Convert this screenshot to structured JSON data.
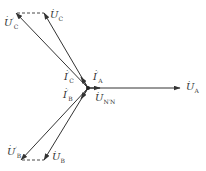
{
  "diagram": {
    "type": "phasor-diagram",
    "origin": {
      "x": 88,
      "y": 88
    },
    "colors": {
      "line": "#333333",
      "background": "#ffffff"
    },
    "vectors": [
      {
        "id": "U_A",
        "label": "U",
        "sub": "A",
        "prime": "",
        "from": [
          88,
          88
        ],
        "to": [
          180,
          88
        ],
        "style": "solid"
      },
      {
        "id": "U_C",
        "label": "U",
        "sub": "C",
        "prime": "",
        "from": [
          88,
          88
        ],
        "to": [
          44,
          13
        ],
        "style": "solid"
      },
      {
        "id": "U_C_prime",
        "label": "U",
        "sub": "C",
        "prime": "′",
        "from": [
          88,
          88
        ],
        "to": [
          16,
          13
        ],
        "style": "solid"
      },
      {
        "id": "U_B",
        "label": "U",
        "sub": "B",
        "prime": "",
        "from": [
          88,
          88
        ],
        "to": [
          44,
          160
        ],
        "style": "solid"
      },
      {
        "id": "U_B_prime",
        "label": "U",
        "sub": "B",
        "prime": "′",
        "from": [
          88,
          88
        ],
        "to": [
          21,
          160
        ],
        "style": "solid"
      },
      {
        "id": "I_A_prime",
        "label": "I",
        "sub": "A",
        "prime": "′",
        "from": [
          88,
          88
        ],
        "to": [
          99,
          88
        ],
        "style": "solid"
      },
      {
        "id": "I_C_prime",
        "label": "I",
        "sub": "C",
        "prime": "′",
        "from": [
          88,
          88
        ],
        "to": [
          80,
          77
        ],
        "style": "solid"
      },
      {
        "id": "I_B_prime",
        "label": "I",
        "sub": "B",
        "prime": "′",
        "from": [
          88,
          88
        ],
        "to": [
          80,
          99
        ],
        "style": "solid"
      }
    ],
    "dashed_links": [
      {
        "from": [
          16,
          13
        ],
        "to": [
          44,
          13
        ]
      },
      {
        "from": [
          21,
          160
        ],
        "to": [
          44,
          160
        ]
      }
    ],
    "labels": {
      "U_A": {
        "text": "U",
        "sub": "A",
        "prime": ""
      },
      "U_C": {
        "text": "U",
        "sub": "C",
        "prime": ""
      },
      "U_C_prime": {
        "text": "U",
        "sub": "C",
        "prime": "′"
      },
      "U_B": {
        "text": "U",
        "sub": "B",
        "prime": ""
      },
      "U_B_prime": {
        "text": "U",
        "sub": "B",
        "prime": "′"
      },
      "I_A_prime": {
        "text": "I",
        "sub": "A",
        "prime": "′"
      },
      "I_C_prime": {
        "text": "I",
        "sub": "C",
        "prime": "′"
      },
      "I_B_prime": {
        "text": "I",
        "sub": "B",
        "prime": "′"
      },
      "U_NN": {
        "text": "U",
        "sub": "N′N",
        "prime": ""
      },
      "dot_glyph": "·"
    }
  }
}
